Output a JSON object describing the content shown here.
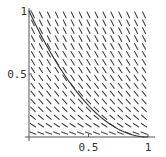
{
  "chart_data": {
    "type": "line",
    "subtype": "slope-field",
    "title": "",
    "xlabel": "",
    "ylabel": "",
    "xlim": [
      0,
      1
    ],
    "ylim": [
      0,
      1
    ],
    "x_ticks": [
      {
        "value": 0.5,
        "label": "0.5"
      },
      {
        "value": 1,
        "label": "1"
      }
    ],
    "y_ticks": [
      {
        "value": 0.5,
        "label": "0.5"
      },
      {
        "value": 1,
        "label": "1"
      }
    ],
    "grid": false,
    "slope_field": {
      "equation": "dy/dx = -2*sqrt(y)",
      "nx": 15,
      "ny": 16,
      "color": "#444444"
    },
    "series": [
      {
        "name": "solution curve",
        "equation": "y = (1 - x)^2",
        "x": [
          0,
          0.1,
          0.2,
          0.3,
          0.4,
          0.5,
          0.6,
          0.7,
          0.8,
          0.9,
          1.0
        ],
        "y": [
          1.0,
          0.81,
          0.64,
          0.49,
          0.36,
          0.25,
          0.16,
          0.09,
          0.04,
          0.01,
          0.0
        ],
        "color": "#333333"
      }
    ],
    "axis_color": "#555555"
  }
}
